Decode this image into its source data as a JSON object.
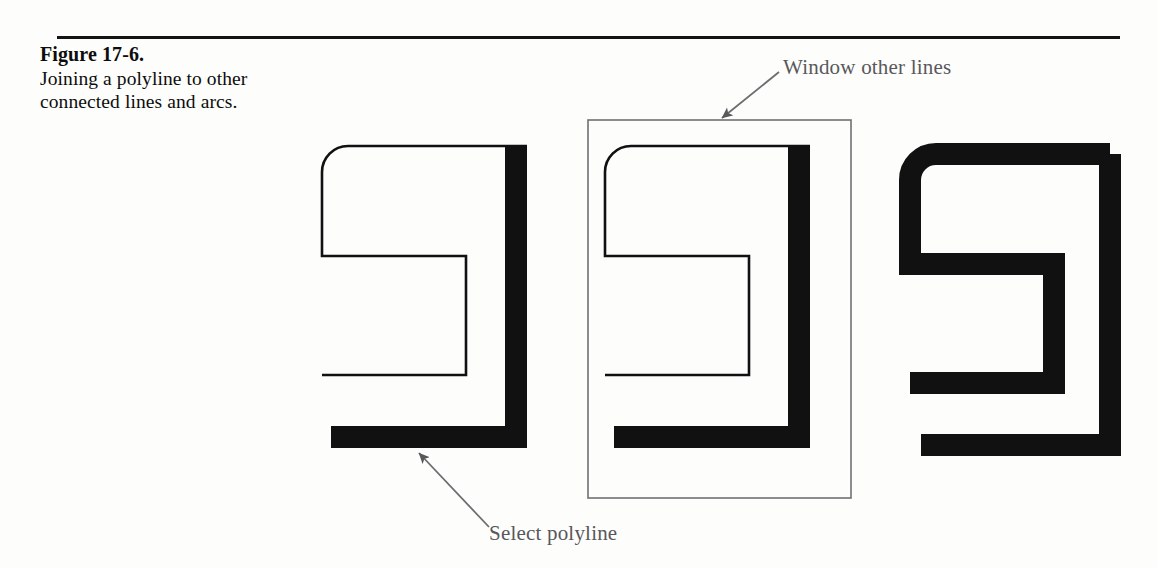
{
  "figure": {
    "caption_title": "Figure 17-6.",
    "caption_body": "Joining a polyline to other connected lines and arcs.",
    "rule_color": "#141414",
    "background_color": "#fdfdfc"
  },
  "annotations": [
    {
      "id": "window-other-lines",
      "label": "Window other lines",
      "color": "#58585a",
      "arrow_from": [
        779,
        72
      ],
      "arrow_to": [
        719,
        120
      ]
    },
    {
      "id": "select-polyline",
      "label": "Select polyline",
      "color": "#58585a",
      "arrow_from": [
        489,
        527
      ],
      "arrow_to": [
        416,
        450
      ]
    }
  ],
  "diagram": {
    "type": "cad-illustration",
    "stroke_color": "#111111",
    "thin_stroke_width": 2,
    "thick_stroke_width": 22,
    "corner_radius": 26,
    "panels": [
      {
        "id": "panel-1-select-polyline",
        "label": "Select polyline",
        "x_offset": 0,
        "thin_path": "M 527 146 L 348 146 A 26 26 0 0 0 322 172 L 322 256 L 466 256 L 466 375 L 322 375",
        "thick_path": "M 516 146 L 516 437 L 320 437",
        "window_rect": null
      },
      {
        "id": "panel-2-window-other-lines",
        "label": "Window other lines",
        "x_offset": 283,
        "thin_path": "M 810 146 L 631 146 A 26 26 0 0 0 605 172 L 605 256 L 749 256 L 749 375 L 605 375",
        "thick_path": "M 799 146 L 799 437 L 603 437",
        "window_rect": {
          "x": 588,
          "y": 120,
          "width": 263,
          "height": 378,
          "stroke": "#6f7072",
          "stroke_width": 1.5
        }
      },
      {
        "id": "panel-3-joined-polyline",
        "label": "Joined polyline",
        "x_offset": 588,
        "thin_path": null,
        "thick_path": "M 1110 154 L 936 154 A 26 26 0 0 0 910 180 L 910 264 L 1054 264 L 1054 383 L 910 383",
        "thick_path_2": "M 1110 154 L 1110 445 L 910 445",
        "window_rect": null
      }
    ]
  }
}
